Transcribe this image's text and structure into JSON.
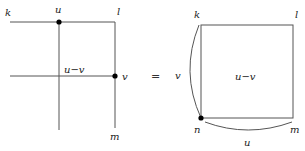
{
  "left_diagram": {
    "labels": {
      "k": "k",
      "u": "u",
      "l": "l",
      "u_minus_v": "u−v",
      "v": "v",
      "m": "m"
    }
  },
  "equals_sign": "=",
  "right_diagram": {
    "labels": {
      "k": "k",
      "l": "l",
      "u_minus_v": "u−v",
      "v": "v",
      "n": "n",
      "m": "m",
      "u": "u"
    }
  },
  "colors": {
    "line": "#555555",
    "dot": "#000000",
    "text": "#222222"
  }
}
